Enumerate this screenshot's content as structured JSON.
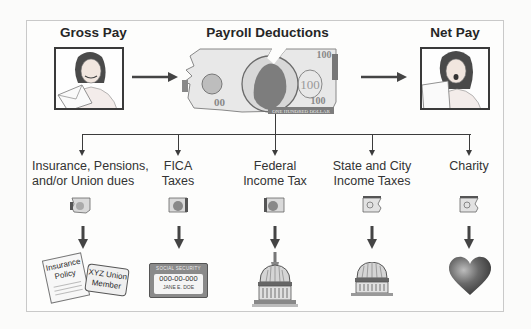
{
  "diagram": {
    "top_row": {
      "gross_pay": {
        "title": "Gross Pay",
        "illustration": "woman-holding-paycheck-envelope"
      },
      "payroll_deductions": {
        "title": "Payroll Deductions",
        "illustration": "torn-hundred-dollar-bill",
        "bill_text": {
          "denomination": "100",
          "caption": "ONE HUNDRED DOLLAR"
        }
      },
      "net_pay": {
        "title": "Net Pay",
        "illustration": "woman-shocked-reading-paycheck"
      }
    },
    "deductions": [
      {
        "line1": "Insurance, Pensions,",
        "line2": "and/or Union dues",
        "result_icon": "insurance-policy-and-union-card",
        "documents": {
          "policy": [
            "Insurance",
            "Policy"
          ],
          "union_card": [
            "XYZ Union",
            "Member"
          ]
        }
      },
      {
        "line1": "FICA",
        "line2": "Taxes",
        "result_icon": "social-security-card",
        "card": {
          "header": "SOCIAL SECURITY",
          "number": "000-00-000",
          "name": "JANE E. DOE"
        }
      },
      {
        "line1": "Federal",
        "line2": "Income Tax",
        "result_icon": "capitol-dome"
      },
      {
        "line1": "State and City",
        "line2": "Income Taxes",
        "result_icon": "state-capitol-dome"
      },
      {
        "line1": "Charity",
        "line2": "",
        "result_icon": "heart"
      }
    ],
    "colors": {
      "line": "#3c3c3c",
      "frame": "#c9c9c9",
      "bill_fill": "#e6e6e6",
      "bill_dark": "#7a7a7a",
      "heart": "#5a5a5a"
    }
  }
}
